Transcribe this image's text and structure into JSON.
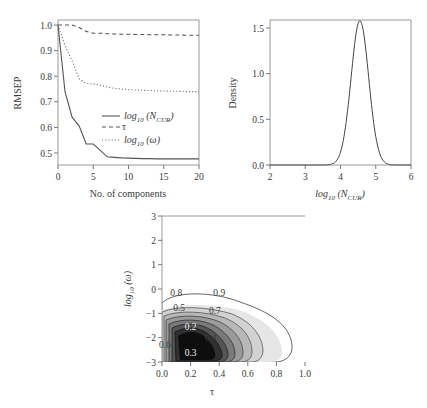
{
  "chart_data": [
    {
      "type": "line",
      "title": "",
      "xlabel": "No. of components",
      "ylabel": "RMSEP",
      "xlim": [
        0,
        20
      ],
      "ylim": [
        0.45,
        1.02
      ],
      "xticks": [
        "0",
        "5",
        "10",
        "15",
        "20"
      ],
      "yticks": [
        "0.5",
        "0.6",
        "0.7",
        "0.8",
        "0.9",
        "1.0"
      ],
      "grid": false,
      "legend_position": "center-right",
      "x": [
        0,
        1,
        2,
        3,
        4,
        5,
        6,
        7,
        8,
        9,
        10,
        11,
        12,
        13,
        14,
        15,
        16,
        17,
        18,
        19,
        20
      ],
      "series": [
        {
          "name": "log10 (N_CUR)",
          "legend_label": "log",
          "legend_sub": "10",
          "legend_rest": " (N",
          "legend_sub2": "CUR",
          "legend_close": ")",
          "style": "solid",
          "values": [
            1.0,
            0.74,
            0.64,
            0.605,
            0.535,
            0.535,
            0.51,
            0.485,
            0.483,
            0.481,
            0.48,
            0.479,
            0.478,
            0.478,
            0.477,
            0.477,
            0.477,
            0.477,
            0.477,
            0.477,
            0.477
          ]
        },
        {
          "name": "τ",
          "legend_label": "τ",
          "style": "dashed",
          "values": [
            1.0,
            1.0,
            1.0,
            0.99,
            0.975,
            0.968,
            0.968,
            0.966,
            0.965,
            0.964,
            0.964,
            0.963,
            0.963,
            0.962,
            0.962,
            0.962,
            0.961,
            0.961,
            0.96,
            0.96,
            0.96
          ]
        },
        {
          "name": "log10 (ω)",
          "legend_label": "log",
          "legend_sub": "10",
          "legend_rest": " (ω)",
          "style": "dotted",
          "values": [
            1.0,
            0.92,
            0.86,
            0.79,
            0.772,
            0.77,
            0.765,
            0.758,
            0.752,
            0.75,
            0.748,
            0.746,
            0.745,
            0.744,
            0.743,
            0.742,
            0.741,
            0.741,
            0.74,
            0.74,
            0.74
          ]
        }
      ]
    },
    {
      "type": "line",
      "title": "",
      "xlabel": "log10 (N_CUR)",
      "xlabel_main": "log",
      "xlabel_sub": "10",
      "xlabel_rest": " (N",
      "xlabel_sub2": "CUR",
      "xlabel_close": ")",
      "ylabel": "Density",
      "xlim": [
        2,
        6
      ],
      "ylim": [
        0,
        1.6
      ],
      "xticks": [
        "2",
        "3",
        "4",
        "5",
        "6"
      ],
      "yticks": [
        "0.0",
        "0.5",
        "1.0",
        "1.5"
      ],
      "grid": false,
      "series": [
        {
          "name": "Density of log10 (N_CUR)",
          "distribution": "normal",
          "mean": 4.55,
          "sd": 0.25,
          "peak": 1.58
        }
      ]
    },
    {
      "type": "heatmap",
      "subtype": "filled-contour",
      "title": "",
      "xlabel": "τ",
      "ylabel": "log10 (ω)",
      "ylabel_main": "log",
      "ylabel_sub": "10",
      "ylabel_rest": " (ω)",
      "xlim": [
        0,
        1
      ],
      "ylim": [
        -3,
        3
      ],
      "xticks": [
        "0.0",
        "0.2",
        "0.4",
        "0.6",
        "0.8",
        "1.0"
      ],
      "yticks": [
        "-3",
        "-2",
        "-1",
        "0",
        "1",
        "2",
        "3"
      ],
      "grid": false,
      "contour_levels": [
        "0.1",
        "0.2",
        "0.3",
        "0.4",
        "0.5",
        "0.6",
        "0.7",
        "0.8",
        "0.9"
      ],
      "contour_labels_shown": [
        {
          "label": "0.9",
          "x": 0.4,
          "y": -0.15
        },
        {
          "label": "0.8",
          "x": 0.1,
          "y": -0.15
        },
        {
          "label": "0.7",
          "x": 0.37,
          "y": -0.9
        },
        {
          "label": "0.5",
          "x": 0.12,
          "y": -0.75
        },
        {
          "label": "0.6",
          "x": 0.02,
          "y": -2.3
        },
        {
          "label": "0.4",
          "x": 0.34,
          "y": -2.0
        },
        {
          "label": "0.2",
          "x": 0.2,
          "y": -1.55
        },
        {
          "label": "0.3",
          "x": 0.2,
          "y": -2.6
        }
      ],
      "mode": {
        "x": 0.2,
        "y": -2.0
      }
    }
  ]
}
